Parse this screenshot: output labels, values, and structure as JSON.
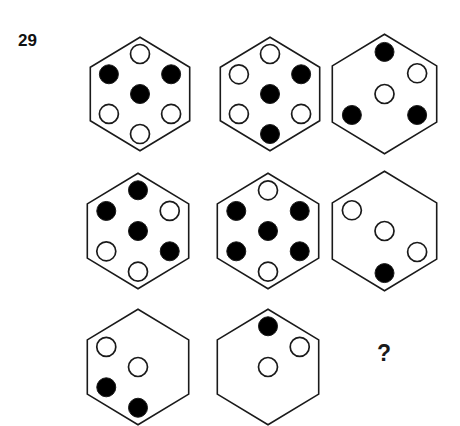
{
  "puzzle": {
    "number": "29",
    "question_mark": "?",
    "type": "hexagon-dot-matrix-reasoning",
    "grid": {
      "rows": 3,
      "cols": 3
    },
    "dot_positions": [
      "top",
      "top-left",
      "top-right",
      "center",
      "bottom-left",
      "bottom-right",
      "bottom"
    ],
    "colors": {
      "outline": "#1a1a1a",
      "filled_dot": "#000000",
      "empty_dot": "#ffffff",
      "background": "#ffffff"
    }
  },
  "geometry": {
    "hex_width": 102,
    "hex_height": 116,
    "dot_radius": 9.5,
    "stroke_width": 1.6,
    "cells": [
      {
        "x": 89,
        "y": 36,
        "w": 102,
        "h": 116
      },
      {
        "x": 219,
        "y": 36,
        "w": 102,
        "h": 116
      },
      {
        "x": 331,
        "y": 33,
        "w": 107,
        "h": 122
      },
      {
        "x": 86,
        "y": 172,
        "w": 104,
        "h": 118
      },
      {
        "x": 216,
        "y": 172,
        "w": 104,
        "h": 118
      },
      {
        "x": 331,
        "y": 170,
        "w": 107,
        "h": 122
      },
      {
        "x": 86,
        "y": 308,
        "w": 104,
        "h": 118
      },
      {
        "x": 216,
        "y": 308,
        "w": 104,
        "h": 118
      }
    ]
  },
  "cells": [
    {
      "id": "cell-1",
      "row": 1,
      "col": 1,
      "label": "row1-col1",
      "dots": {
        "top": "empty",
        "top-left": "filled",
        "top-right": "filled",
        "center": "filled",
        "bottom-left": "empty",
        "bottom-right": "empty",
        "bottom": "empty"
      }
    },
    {
      "id": "cell-2",
      "row": 1,
      "col": 2,
      "label": "row1-col2",
      "dots": {
        "top": "empty",
        "top-left": "empty",
        "top-right": "filled",
        "center": "filled",
        "bottom-left": "empty",
        "bottom-right": "empty",
        "bottom": "filled"
      }
    },
    {
      "id": "cell-3",
      "row": 1,
      "col": 3,
      "label": "row1-col3",
      "dots": {
        "top": "filled",
        "top-left": "none",
        "top-right": "empty",
        "center": "empty",
        "bottom-left": "filled",
        "bottom-right": "filled",
        "bottom": "none"
      }
    },
    {
      "id": "cell-4",
      "row": 2,
      "col": 1,
      "label": "row2-col1",
      "dots": {
        "top": "filled",
        "top-left": "filled",
        "top-right": "empty",
        "center": "filled",
        "bottom-left": "empty",
        "bottom-right": "filled",
        "bottom": "empty"
      }
    },
    {
      "id": "cell-5",
      "row": 2,
      "col": 2,
      "label": "row2-col2",
      "dots": {
        "top": "empty",
        "top-left": "filled",
        "top-right": "filled",
        "center": "filled",
        "bottom-left": "filled",
        "bottom-right": "filled",
        "bottom": "empty"
      }
    },
    {
      "id": "cell-6",
      "row": 2,
      "col": 3,
      "label": "row2-col3",
      "dots": {
        "top": "none",
        "top-left": "empty",
        "top-right": "none",
        "center": "empty",
        "bottom-left": "none",
        "bottom-right": "empty",
        "bottom": "filled"
      }
    },
    {
      "id": "cell-7",
      "row": 3,
      "col": 1,
      "label": "row3-col1",
      "dots": {
        "top": "none",
        "top-left": "empty",
        "top-right": "none",
        "center": "empty",
        "bottom-left": "filled",
        "bottom-right": "none",
        "bottom": "filled"
      }
    },
    {
      "id": "cell-8",
      "row": 3,
      "col": 2,
      "label": "row3-col2",
      "dots": {
        "top": "filled",
        "top-left": "none",
        "top-right": "empty",
        "center": "empty",
        "bottom-left": "none",
        "bottom-right": "none",
        "bottom": "none"
      }
    }
  ]
}
